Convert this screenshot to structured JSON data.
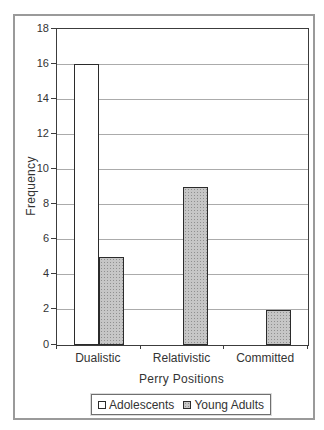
{
  "chart_data": {
    "type": "bar",
    "title": "",
    "categories": [
      "Dualistic",
      "Relativistic",
      "Committed"
    ],
    "series": [
      {
        "name": "Adolescents",
        "values": [
          16,
          0,
          0
        ],
        "fill": "white"
      },
      {
        "name": "Young Adults",
        "values": [
          5,
          9,
          2
        ],
        "fill": "gray-stipple"
      }
    ],
    "xlabel": "Perry Positions",
    "ylabel": "Frequency",
    "ylim": [
      0,
      18
    ],
    "yticks": [
      0,
      2,
      4,
      6,
      8,
      10,
      12,
      14,
      16,
      18
    ],
    "grid": "horizontal",
    "legend_position": "bottom",
    "legend_labels": [
      "Adolescents",
      "Young Adults"
    ]
  },
  "colors": {
    "background": "#ffffff",
    "figure_border": "#9a9a9a",
    "plot_border": "#3c3c3c",
    "gridline": "#ababab",
    "bar_border": "#2b2b2b",
    "adolescents_fill": "#ffffff",
    "young_adults_fill": "#c6c6c6",
    "text": "#333333"
  }
}
